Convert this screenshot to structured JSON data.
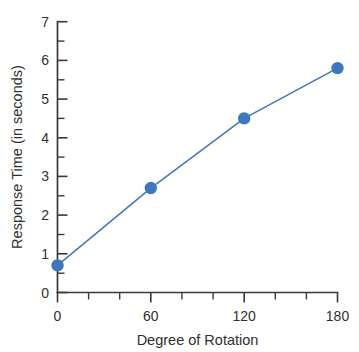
{
  "chart_data": {
    "type": "line",
    "title": "",
    "xlabel": "Degree of Rotation",
    "ylabel": "Response Time (in seconds)",
    "x": [
      0,
      60,
      120,
      180
    ],
    "values": [
      0.7,
      2.7,
      4.5,
      5.8
    ],
    "series": [
      {
        "name": "Response Time",
        "x": [
          0,
          60,
          120,
          180
        ],
        "values": [
          0.7,
          2.7,
          4.5,
          5.8
        ]
      }
    ],
    "xlim": [
      0,
      180
    ],
    "ylim": [
      0,
      7
    ],
    "x_tick_labels": [
      "0",
      "60",
      "120",
      "180"
    ],
    "x_tick_values": [
      0,
      60,
      120,
      180
    ],
    "x_minor_tick_values": [
      20,
      40,
      80,
      100,
      140,
      160
    ],
    "y_tick_labels": [
      "0",
      "1",
      "2",
      "3",
      "4",
      "5",
      "6",
      "7"
    ],
    "y_tick_values": [
      0,
      1,
      2,
      3,
      4,
      5,
      6,
      7
    ],
    "y_minor_tick_values": [
      0.5,
      1.5,
      2.5,
      3.5,
      4.5,
      5.5,
      6.5
    ],
    "grid": false,
    "legend": false,
    "legend_position": "none",
    "marker": "circle",
    "colors": {
      "series": "#3e77bc",
      "axis": "#3a3a3a",
      "text": "#2f2f2f",
      "background": "#ffffff"
    }
  }
}
